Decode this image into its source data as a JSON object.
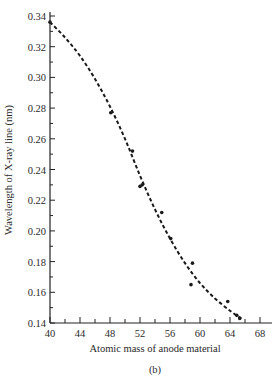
{
  "chart_data": {
    "type": "scatter",
    "title": "",
    "caption": "(b)",
    "xlabel": "Atomic mass of anode material",
    "ylabel": "Wavelength of X-ray line (nm)",
    "xlim": [
      40,
      68
    ],
    "ylim": [
      0.14,
      0.34
    ],
    "x_ticks": [
      40,
      44,
      48,
      52,
      56,
      60,
      64,
      68
    ],
    "x_minor_step": 2,
    "y_ticks": [
      0.14,
      0.16,
      0.18,
      0.2,
      0.22,
      0.24,
      0.26,
      0.28,
      0.3,
      0.32,
      0.34
    ],
    "y_tick_labels": [
      "0.14",
      "0.16",
      "0.18",
      "0.20",
      "0.22",
      "0.24",
      "0.26",
      "0.28",
      "0.30",
      "0.32",
      "0.34"
    ],
    "y_minor_step": 0.01,
    "grid": false,
    "legend": null,
    "series": [
      {
        "name": "measured points",
        "style": "dots",
        "color": "#1a1a1a",
        "points": [
          {
            "x": 40.0,
            "y": 0.336
          },
          {
            "x": 48.1,
            "y": 0.277
          },
          {
            "x": 51.0,
            "y": 0.252
          },
          {
            "x": 52.0,
            "y": 0.229
          },
          {
            "x": 52.3,
            "y": 0.23
          },
          {
            "x": 54.9,
            "y": 0.212
          },
          {
            "x": 56.1,
            "y": 0.195
          },
          {
            "x": 59.0,
            "y": 0.179
          },
          {
            "x": 58.8,
            "y": 0.165
          },
          {
            "x": 63.7,
            "y": 0.154
          },
          {
            "x": 64.9,
            "y": 0.145
          },
          {
            "x": 65.3,
            "y": 0.143
          }
        ]
      },
      {
        "name": "fitted curve",
        "style": "dashed",
        "color": "#1a1a1a",
        "points": [
          {
            "x": 40.0,
            "y": 0.336
          },
          {
            "x": 42.0,
            "y": 0.326
          },
          {
            "x": 44.0,
            "y": 0.314
          },
          {
            "x": 46.0,
            "y": 0.299
          },
          {
            "x": 48.0,
            "y": 0.281
          },
          {
            "x": 50.0,
            "y": 0.26
          },
          {
            "x": 52.0,
            "y": 0.236
          },
          {
            "x": 54.0,
            "y": 0.214
          },
          {
            "x": 56.0,
            "y": 0.195
          },
          {
            "x": 58.0,
            "y": 0.179
          },
          {
            "x": 60.0,
            "y": 0.166
          },
          {
            "x": 62.0,
            "y": 0.156
          },
          {
            "x": 64.0,
            "y": 0.148
          },
          {
            "x": 65.5,
            "y": 0.143
          }
        ]
      }
    ]
  }
}
